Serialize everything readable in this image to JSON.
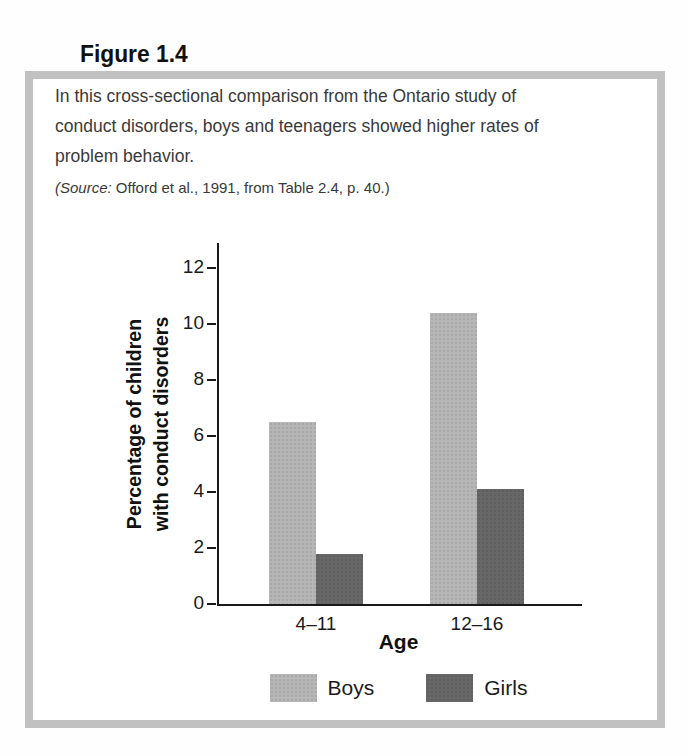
{
  "figure": {
    "label": "Figure 1.4",
    "caption": "In this cross-sectional comparison from the Ontario study of conduct disorders, boys and teenagers showed higher rates of problem behavior.",
    "source_prefix": "(Source:",
    "source_rest": " Offord et al., 1991, from Table 2.4, p. 40.)"
  },
  "chart_data": {
    "type": "bar",
    "title": "",
    "categories": [
      "4–11",
      "12–16"
    ],
    "series": [
      {
        "name": "Boys",
        "values": [
          6.5,
          10.4
        ],
        "color": "#b6b6b6"
      },
      {
        "name": "Girls",
        "values": [
          1.8,
          4.1
        ],
        "color": "#676767"
      }
    ],
    "xlabel": "Age",
    "ylabel": "Percentage of children with conduct disorders",
    "ylabel_lines": [
      "Percentage of children",
      "with conduct disorders"
    ],
    "yticks": [
      0,
      2,
      4,
      6,
      8,
      10,
      12
    ],
    "ylim": [
      0,
      12.9
    ],
    "grid": false,
    "legend_position": "bottom"
  },
  "colors": {
    "box_border": "#c1c1c1",
    "axis": "#1a1a1a",
    "caption_text": "#3a3a3a"
  }
}
